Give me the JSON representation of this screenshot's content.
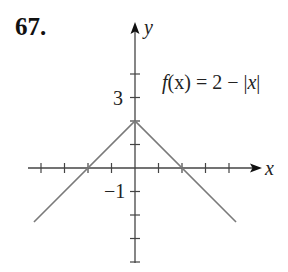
{
  "problem": {
    "number": "67."
  },
  "chart_data": {
    "type": "line",
    "title": "",
    "function_label": "f(x) = 2 − |x|",
    "function_parts": {
      "f": "f",
      "arg": "(x) = 2 − ",
      "abs_open": "|",
      "abs_var": "x",
      "abs_close": "|"
    },
    "xlabel": "x",
    "ylabel": "y",
    "tick_labels": {
      "y_pos": "3",
      "y_neg": "−1"
    },
    "x_ticks": [
      -4,
      -3,
      -2,
      -1,
      1,
      2,
      3,
      4
    ],
    "y_ticks": [
      -4,
      -3,
      -2,
      -1,
      1,
      2,
      3,
      4
    ],
    "xlim": [
      -4.6,
      5.3
    ],
    "ylim": [
      -4.1,
      6.2
    ],
    "grid": false,
    "series": [
      {
        "name": "f(x) = 2 − |x|",
        "x": [
          -4.3,
          0,
          4.3
        ],
        "y": [
          -2.3,
          2,
          -2.3
        ],
        "color": "#7a7a7a"
      }
    ],
    "axis_color": "#444444"
  }
}
